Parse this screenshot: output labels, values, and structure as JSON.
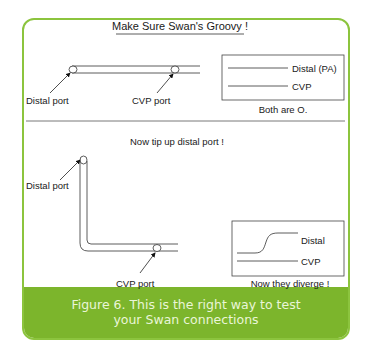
{
  "title": "Make Sure Swan's Groovy !",
  "panel_top": {
    "distal_port_label": "Distal port",
    "cvp_port_label": "CVP port",
    "legend": {
      "distal_label": "Distal (PA)",
      "cvp_label": "CVP"
    },
    "note": "Both are O."
  },
  "panel_bottom": {
    "instruction": "Now tip up distal port !",
    "distal_port_label": "Distal port",
    "cvp_port_label": "CVP port",
    "legend": {
      "distal_label": "Distal",
      "cvp_label": "CVP"
    },
    "note": "Now they diverge !"
  },
  "caption": "Figure 6. This is the right way to test your Swan connections",
  "colors": {
    "frame_green": "#8cc43e",
    "caption_green": "#7cb52c",
    "caption_text": "#eaf5d8"
  }
}
